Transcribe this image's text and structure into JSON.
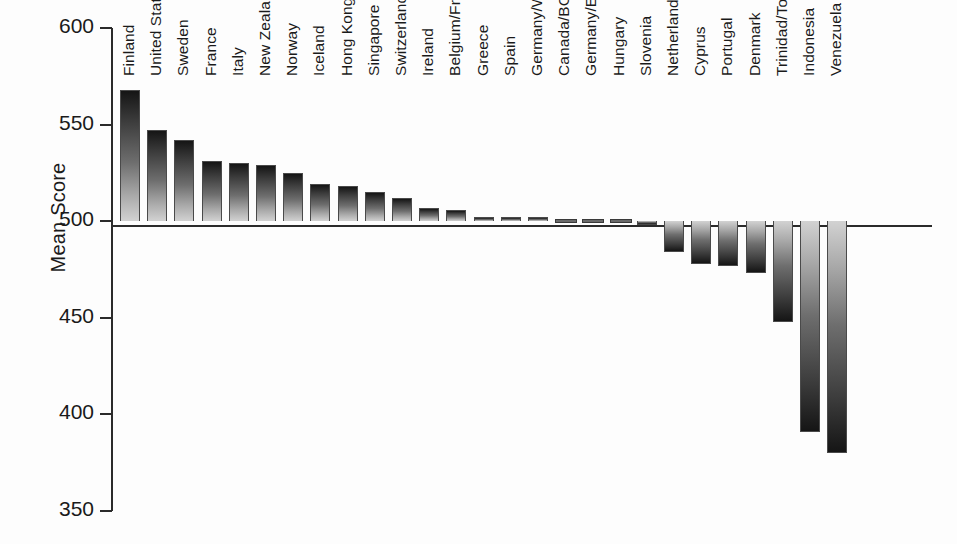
{
  "chart_data": {
    "type": "bar",
    "title": "",
    "xlabel": "",
    "ylabel": "Mean Score",
    "ylim": [
      350,
      600
    ],
    "yticks": [
      600,
      550,
      500,
      450,
      400,
      350
    ],
    "baseline": 500,
    "grid": false,
    "legend": null,
    "categories": [
      "Finland",
      "United States",
      "Sweden",
      "France",
      "Italy",
      "New Zealand",
      "Norway",
      "Iceland",
      "Hong Kong",
      "Singapore",
      "Switzerland",
      "Ireland",
      "Belgium/Fr",
      "Greece",
      "Spain",
      "Germany/W",
      "Canada/BC",
      "Germany/E",
      "Hungary",
      "Slovenia",
      "Netherlands",
      "Cyprus",
      "Portugal",
      "Denmark",
      "Trinidad/Tobago",
      "Indonesia",
      "Venezuela"
    ],
    "values": [
      568,
      547,
      542,
      531,
      530,
      529,
      525,
      519,
      518,
      515,
      512,
      507,
      506,
      502,
      502,
      502,
      500,
      499,
      499,
      498,
      484,
      478,
      477,
      473,
      448,
      391,
      380
    ]
  },
  "axis": {
    "y_title": "Mean Score",
    "y_tick_labels": [
      "600",
      "550",
      "500",
      "450",
      "400",
      "350"
    ]
  }
}
